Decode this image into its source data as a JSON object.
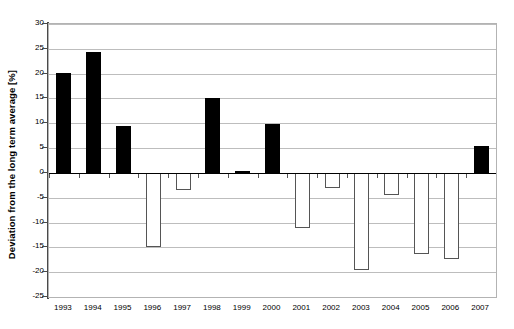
{
  "chart_data": {
    "type": "bar",
    "title": "",
    "subtitle": "",
    "xlabel": "",
    "ylabel": "Deviation from the long term average [%]",
    "categories": [
      "1993",
      "1994",
      "1995",
      "1996",
      "1997",
      "1998",
      "1999",
      "2000",
      "2001",
      "2002",
      "2003",
      "2004",
      "2005",
      "2006",
      "2007"
    ],
    "values": [
      20.1,
      24.3,
      9.4,
      -15.0,
      -3.4,
      15.0,
      0.4,
      9.9,
      -11.0,
      -3.0,
      -19.6,
      -4.4,
      -16.3,
      -17.4,
      5.5
    ],
    "series": [
      {
        "name": "Deviation from the long term average",
        "values": [
          20.1,
          24.3,
          9.4,
          -15.0,
          -3.4,
          15.0,
          0.4,
          9.9,
          -11.0,
          -3.0,
          -19.6,
          -4.4,
          -16.3,
          -17.4,
          5.5
        ]
      }
    ],
    "ylim": [
      -25,
      30
    ],
    "ytick_step": 5,
    "yticks": [
      30,
      25,
      20,
      15,
      10,
      5,
      0,
      -5,
      -10,
      -15,
      -20,
      -25
    ],
    "ytick_labels": [
      "30",
      "25",
      "20",
      "15",
      "10",
      "5",
      "0",
      "-5",
      "-10",
      "-15",
      "-20",
      "-25"
    ],
    "grid": true,
    "grid_axis": "y",
    "legend": false,
    "legend_position": "none",
    "annotations": [],
    "colors": {
      "positive_bar": "#000000",
      "negative_bar_fill": "#ffffff",
      "negative_bar_stroke": "#555555",
      "gridline": "#bdbdbd",
      "zero_line": "#000000",
      "axis": "#4a4a4a",
      "frame": "#b3b3b3",
      "background": "#ffffff",
      "text": "#000000"
    }
  }
}
